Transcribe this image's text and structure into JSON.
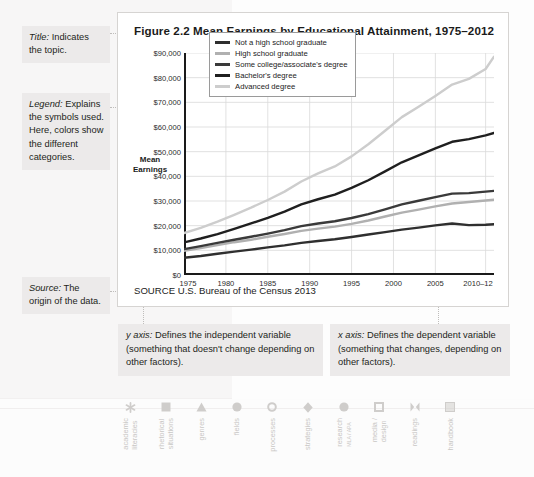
{
  "annotations": {
    "title_note": {
      "term": "Title:",
      "text": " Indicates the topic."
    },
    "legend_note": {
      "term": "Legend:",
      "text": " Explains the symbols used. Here, colors show the different categories."
    },
    "source_note": {
      "term": "Source:",
      "text": " The origin of the data."
    },
    "y_axis_note": {
      "term": "y axis:",
      "text": " Defines the independent variable (something that doesn't change depending on other factors)."
    },
    "x_axis_note": {
      "term": "x axis:",
      "text": " Defines the dependent variable (something that changes, depending on other factors)."
    }
  },
  "figure": {
    "title": "Figure 2.2  Mean Earnings by Educational Attainment, 1975–2012",
    "source": "SOURCE  U.S. Bureau of the Census 2013",
    "axis_title": "Mean\nEarnings"
  },
  "chart_data": {
    "type": "line",
    "title": "Figure 2.2  Mean Earnings by Educational Attainment, 1975–2012",
    "xlabel": "",
    "ylabel": "Mean Earnings",
    "ylim": [
      0,
      90000
    ],
    "xlim": [
      1975,
      2012
    ],
    "grid": true,
    "legend_position": "top-left-inside",
    "ytick_labels": [
      "$90,000",
      "$80,000",
      "$70,000",
      "$60,000",
      "$50,000",
      "$40,000",
      "$30,000",
      "$20,000",
      "$10,000",
      "$0"
    ],
    "ytick_values": [
      90000,
      80000,
      70000,
      60000,
      50000,
      40000,
      30000,
      20000,
      10000,
      0
    ],
    "xtick_labels": [
      "1975",
      "1980",
      "1985",
      "1990",
      "1995",
      "2000",
      "2005",
      "2010–12"
    ],
    "xtick_values": [
      1975,
      1980,
      1985,
      1990,
      1995,
      2000,
      2005,
      2011
    ],
    "x": [
      1975,
      1977,
      1979,
      1981,
      1983,
      1985,
      1987,
      1989,
      1991,
      1993,
      1995,
      1997,
      1999,
      2001,
      2003,
      2005,
      2007,
      2009,
      2011,
      2012
    ],
    "series": [
      {
        "name": "Not a high school graduate",
        "color": "#2f2f2f",
        "values": [
          7000,
          7700,
          8600,
          9500,
          10300,
          11200,
          12000,
          13000,
          13800,
          14500,
          15400,
          16400,
          17400,
          18400,
          19200,
          20100,
          20900,
          20200,
          20400,
          20600
        ]
      },
      {
        "name": "High school graduate",
        "color": "#b0b0b0",
        "values": [
          9800,
          10900,
          12100,
          13300,
          14300,
          15500,
          16600,
          17900,
          18800,
          19600,
          20700,
          22100,
          23700,
          25300,
          26500,
          27800,
          29000,
          29600,
          30200,
          30500
        ]
      },
      {
        "name": "Some college/associate's degree",
        "color": "#3a3a3a",
        "values": [
          10500,
          11700,
          13000,
          14300,
          15500,
          16800,
          18200,
          19800,
          20900,
          21800,
          23100,
          24700,
          26600,
          28600,
          30100,
          31600,
          33000,
          33200,
          33800,
          34100
        ]
      },
      {
        "name": "Bachelor's degree",
        "color": "#1f1f1f",
        "values": [
          13200,
          14800,
          16600,
          18700,
          20900,
          23200,
          25700,
          28600,
          30700,
          32600,
          35300,
          38400,
          42000,
          45700,
          48500,
          51300,
          54000,
          55100,
          56600,
          57600
        ]
      },
      {
        "name": "Advanced degree",
        "color": "#cdcdcd",
        "values": [
          17000,
          19100,
          21600,
          24400,
          27300,
          30400,
          33800,
          37900,
          41200,
          44000,
          48100,
          53000,
          58500,
          64000,
          68200,
          72600,
          77200,
          79500,
          83500,
          88500
        ]
      }
    ]
  },
  "nav": {
    "items": [
      {
        "label": "academic\nliteracies",
        "icon": "asterisk-icon"
      },
      {
        "label": "rhetorical\nsituations",
        "icon": "filled-square-icon"
      },
      {
        "label": "genres",
        "icon": "triangle-icon"
      },
      {
        "label": "fields",
        "icon": "filled-circle-icon"
      },
      {
        "label": "processes",
        "icon": "hollow-circle-icon"
      },
      {
        "label": "strategies",
        "icon": "diamond-icon"
      },
      {
        "label": "research",
        "sub": "MLA / APA",
        "icon": "filled-circle-icon"
      },
      {
        "label": "media /\ndesign",
        "icon": "hollow-square-icon"
      },
      {
        "label": "readings",
        "icon": "bowtie-icon"
      },
      {
        "label": "handbook",
        "icon": "shaded-square-icon"
      }
    ]
  }
}
